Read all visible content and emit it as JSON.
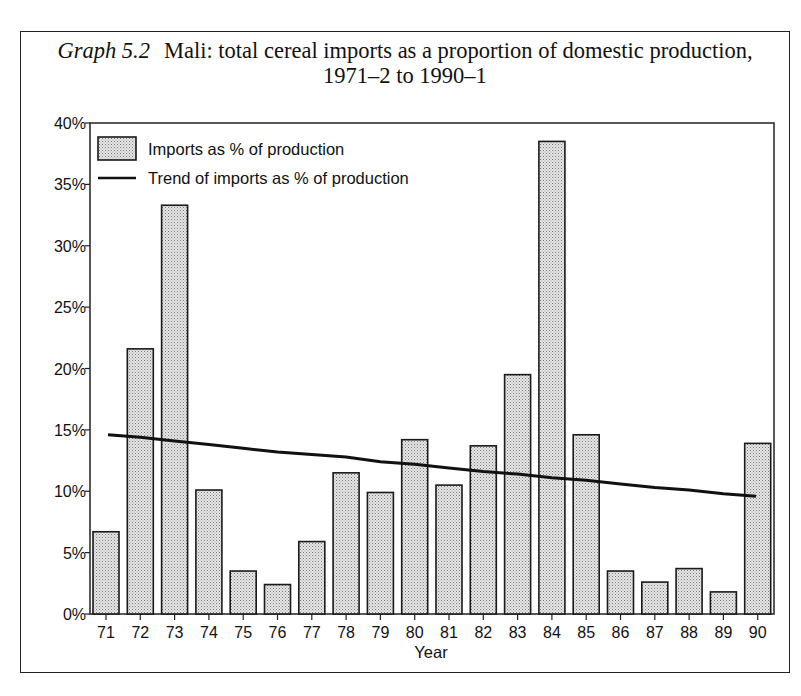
{
  "figure": {
    "number_label": "Graph 5.2",
    "title_line1": "Mali: total cereal imports as a proportion of domestic production,",
    "title_line2": "1971–2 to 1990–1"
  },
  "chart_data": {
    "type": "bar",
    "xlabel": "Year",
    "ylabel": "",
    "categories": [
      "71",
      "72",
      "73",
      "74",
      "75",
      "76",
      "77",
      "78",
      "79",
      "80",
      "81",
      "82",
      "83",
      "84",
      "85",
      "86",
      "87",
      "88",
      "89",
      "90"
    ],
    "series": [
      {
        "name": "Imports as % of production",
        "type": "bar",
        "values": [
          6.7,
          21.6,
          33.3,
          10.1,
          3.5,
          2.4,
          5.9,
          11.5,
          9.9,
          14.2,
          10.5,
          13.7,
          19.5,
          38.5,
          14.6,
          3.5,
          2.6,
          3.7,
          1.8,
          13.9
        ]
      },
      {
        "name": "Trend of imports as % of production",
        "type": "line",
        "values": [
          14.6,
          14.4,
          14.1,
          13.8,
          13.5,
          13.2,
          13.0,
          12.8,
          12.4,
          12.2,
          11.9,
          11.6,
          11.4,
          11.1,
          10.9,
          10.6,
          10.3,
          10.1,
          9.8,
          9.6
        ]
      }
    ],
    "yticks": [
      "0%",
      "5%",
      "10%",
      "15%",
      "20%",
      "25%",
      "30%",
      "35%",
      "40%"
    ],
    "ylim": [
      0,
      40
    ],
    "grid": false,
    "legend_position": "top-left, inside plot",
    "colors": {
      "bar_fill": "#d4d4d4",
      "bar_stroke": "#1a1a1a",
      "trend_line": "#111111"
    }
  }
}
